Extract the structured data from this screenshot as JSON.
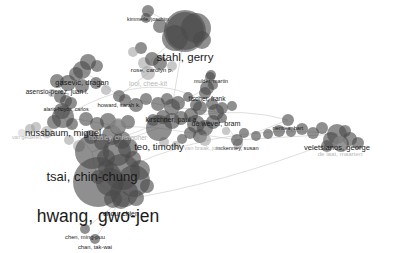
{
  "view": {
    "type": "network-map",
    "background": "#ffffff",
    "node_color": "#4a4a4a",
    "edge_color": "#d0d0d0",
    "label_color": "#1a1a1a",
    "width": 401,
    "height": 253
  },
  "chart_data": {
    "type": "scatter",
    "title": "",
    "xlabel": "",
    "ylabel": "",
    "nodes": [
      {
        "label": "kimmerle, joachim",
        "x": 148,
        "y": 11,
        "r": 6,
        "font": 5.2,
        "tone": "dark",
        "lx": 148,
        "ly": 11
      },
      {
        "label": "stahl, gerry",
        "x": 185,
        "y": 31,
        "r": 21,
        "font": 11.5,
        "tone": "dark",
        "lx": 185,
        "ly": 30
      },
      {
        "label": "rose, carolyn p.",
        "x": 152,
        "y": 59,
        "r": 7,
        "font": 6.2,
        "tone": "dark",
        "lx": 152,
        "ly": 59
      },
      {
        "label": "gasevic, dragan",
        "x": 82,
        "y": 70,
        "r": 9,
        "font": 7.6,
        "tone": "dark",
        "lx": 82,
        "ly": 69
      },
      {
        "label": "asensio-perez, juan i.",
        "x": 57,
        "y": 81,
        "r": 7,
        "font": 6.6,
        "tone": "dark",
        "lx": 57,
        "ly": 81
      },
      {
        "label": "looi, chee-kit",
        "x": 148,
        "y": 73,
        "r": 7,
        "font": 6.8,
        "tone": "faint",
        "lx": 148,
        "ly": 73
      },
      {
        "label": "mulder, martin",
        "x": 211,
        "y": 75,
        "r": 5,
        "font": 5.4,
        "tone": "dark",
        "lx": 211,
        "ly": 74
      },
      {
        "label": "fischer, frank",
        "x": 207,
        "y": 88,
        "r": 7,
        "font": 6.5,
        "tone": "dark",
        "lx": 207,
        "ly": 88
      },
      {
        "label": "alario-hoyos, carlos",
        "x": 66,
        "y": 101,
        "r": 6,
        "font": 5.2,
        "tone": "dark",
        "lx": 66,
        "ly": 101
      },
      {
        "label": "howard, sarah k.",
        "x": 119,
        "y": 96,
        "r": 6,
        "font": 5.8,
        "tone": "dark",
        "lx": 119,
        "ly": 96
      },
      {
        "label": "kirschner, paul a.",
        "x": 172,
        "y": 107,
        "r": 8,
        "font": 7.0,
        "tone": "dark",
        "lx": 172,
        "ly": 107
      },
      {
        "label": "de wever, bram",
        "x": 216,
        "y": 112,
        "r": 8,
        "font": 7.2,
        "tone": "dark",
        "lx": 216,
        "ly": 112
      },
      {
        "label": "nussbaum, miguel",
        "x": 63,
        "y": 117,
        "r": 11,
        "font": 9.4,
        "tone": "dark",
        "lx": 63,
        "ly": 116
      },
      {
        "label": "hoadley, christopher",
        "x": 118,
        "y": 126,
        "r": 8,
        "font": 6.5,
        "tone": "faint",
        "lx": 118,
        "ly": 126
      },
      {
        "label": "teo, timothy",
        "x": 159,
        "y": 128,
        "r": 13,
        "font": 9.6,
        "tone": "dark",
        "lx": 159,
        "ly": 128
      },
      {
        "label": "rienties, bart",
        "x": 288,
        "y": 120,
        "r": 6,
        "font": 5.6,
        "tone": "dark",
        "lx": 288,
        "ly": 120
      },
      {
        "label": "veletsianos, george",
        "x": 337,
        "y": 134,
        "r": 10,
        "font": 7.6,
        "tone": "dark",
        "lx": 337,
        "ly": 133
      },
      {
        "label": "mckenney, susan",
        "x": 237,
        "y": 140,
        "r": 6,
        "font": 5.6,
        "tone": "dark",
        "lx": 237,
        "ly": 140
      },
      {
        "label": "van gelderen, ...",
        "x": 30,
        "y": 129,
        "r": 5,
        "font": 5.0,
        "tone": "faint",
        "lx": 30,
        "ly": 129
      },
      {
        "label": "de laat, maarten",
        "x": 340,
        "y": 143,
        "r": 7,
        "font": 6.2,
        "tone": "faint",
        "lx": 340,
        "ly": 143
      },
      {
        "label": "van braak, johan",
        "x": 205,
        "y": 140,
        "r": 6,
        "font": 5.6,
        "tone": "faint",
        "lx": 205,
        "ly": 140
      },
      {
        "label": "tsai, chin-chung",
        "x": 92,
        "y": 152,
        "r": 17,
        "font": 13.0,
        "tone": "dark",
        "lx": 92,
        "ly": 151
      },
      {
        "label": "hwang, gwo-jen",
        "x": 98,
        "y": 182,
        "r": 25,
        "font": 17.5,
        "tone": "dark",
        "lx": 98,
        "ly": 181
      },
      {
        "label": "chou, chien",
        "x": 121,
        "y": 200,
        "r": 9,
        "font": 7.0,
        "tone": "dark",
        "lx": 121,
        "ly": 200
      },
      {
        "label": "chen, ming-puu",
        "x": 85,
        "y": 229,
        "r": 5,
        "font": 5.8,
        "tone": "dark",
        "lx": 85,
        "ly": 229
      },
      {
        "label": "chan, tak-wai",
        "x": 95,
        "y": 239,
        "r": 5,
        "font": 5.8,
        "tone": "dark",
        "lx": 95,
        "ly": 239
      }
    ],
    "cluster_blobs": [
      {
        "x": 185,
        "y": 31,
        "r": 19,
        "tone": "dark"
      },
      {
        "x": 196,
        "y": 28,
        "r": 15,
        "tone": "dark"
      },
      {
        "x": 175,
        "y": 38,
        "r": 13,
        "tone": "dark"
      },
      {
        "x": 202,
        "y": 40,
        "r": 9,
        "tone": "dark"
      },
      {
        "x": 160,
        "y": 26,
        "r": 7,
        "tone": "dark"
      },
      {
        "x": 146,
        "y": 18,
        "r": 5,
        "tone": "dark"
      },
      {
        "x": 141,
        "y": 48,
        "r": 6,
        "tone": "dark"
      },
      {
        "x": 133,
        "y": 52,
        "r": 5,
        "tone": "light"
      },
      {
        "x": 160,
        "y": 63,
        "r": 7,
        "tone": "dark"
      },
      {
        "x": 172,
        "y": 66,
        "r": 5,
        "tone": "light"
      },
      {
        "x": 144,
        "y": 63,
        "r": 6,
        "tone": "light"
      },
      {
        "x": 88,
        "y": 62,
        "r": 8,
        "tone": "dark"
      },
      {
        "x": 97,
        "y": 66,
        "r": 6,
        "tone": "dark"
      },
      {
        "x": 76,
        "y": 74,
        "r": 7,
        "tone": "dark"
      },
      {
        "x": 68,
        "y": 83,
        "r": 8,
        "tone": "dark"
      },
      {
        "x": 82,
        "y": 86,
        "r": 7,
        "tone": "dark"
      },
      {
        "x": 96,
        "y": 83,
        "r": 6,
        "tone": "dark"
      },
      {
        "x": 106,
        "y": 90,
        "r": 5,
        "tone": "light"
      },
      {
        "x": 60,
        "y": 97,
        "r": 6,
        "tone": "dark"
      },
      {
        "x": 71,
        "y": 103,
        "r": 6,
        "tone": "dark"
      },
      {
        "x": 52,
        "y": 93,
        "r": 4,
        "tone": "light"
      },
      {
        "x": 125,
        "y": 100,
        "r": 6,
        "tone": "dark"
      },
      {
        "x": 136,
        "y": 105,
        "r": 7,
        "tone": "dark"
      },
      {
        "x": 146,
        "y": 99,
        "r": 6,
        "tone": "dark"
      },
      {
        "x": 158,
        "y": 104,
        "r": 7,
        "tone": "dark"
      },
      {
        "x": 167,
        "y": 99,
        "r": 6,
        "tone": "dark"
      },
      {
        "x": 178,
        "y": 103,
        "r": 7,
        "tone": "dark"
      },
      {
        "x": 188,
        "y": 97,
        "r": 5,
        "tone": "dark"
      },
      {
        "x": 196,
        "y": 105,
        "r": 6,
        "tone": "dark"
      },
      {
        "x": 205,
        "y": 93,
        "r": 6,
        "tone": "dark"
      },
      {
        "x": 213,
        "y": 85,
        "r": 5,
        "tone": "dark"
      },
      {
        "x": 210,
        "y": 77,
        "r": 5,
        "tone": "dark"
      },
      {
        "x": 200,
        "y": 108,
        "r": 7,
        "tone": "dark"
      },
      {
        "x": 212,
        "y": 104,
        "r": 6,
        "tone": "dark"
      },
      {
        "x": 222,
        "y": 108,
        "r": 6,
        "tone": "dark"
      },
      {
        "x": 232,
        "y": 106,
        "r": 5,
        "tone": "dark"
      },
      {
        "x": 191,
        "y": 115,
        "r": 7,
        "tone": "dark"
      },
      {
        "x": 181,
        "y": 118,
        "r": 7,
        "tone": "dark"
      },
      {
        "x": 172,
        "y": 121,
        "r": 8,
        "tone": "dark"
      },
      {
        "x": 163,
        "y": 117,
        "r": 7,
        "tone": "dark"
      },
      {
        "x": 153,
        "y": 120,
        "r": 6,
        "tone": "dark"
      },
      {
        "x": 196,
        "y": 124,
        "r": 9,
        "tone": "dark"
      },
      {
        "x": 205,
        "y": 128,
        "r": 8,
        "tone": "dark"
      },
      {
        "x": 213,
        "y": 122,
        "r": 7,
        "tone": "dark"
      },
      {
        "x": 200,
        "y": 136,
        "r": 7,
        "tone": "dark"
      },
      {
        "x": 190,
        "y": 133,
        "r": 6,
        "tone": "dark"
      },
      {
        "x": 182,
        "y": 139,
        "r": 5,
        "tone": "dark"
      },
      {
        "x": 222,
        "y": 118,
        "r": 5,
        "tone": "dark"
      },
      {
        "x": 62,
        "y": 111,
        "r": 8,
        "tone": "dark"
      },
      {
        "x": 54,
        "y": 122,
        "r": 7,
        "tone": "dark"
      },
      {
        "x": 72,
        "y": 124,
        "r": 6,
        "tone": "dark"
      },
      {
        "x": 86,
        "y": 119,
        "r": 7,
        "tone": "dark"
      },
      {
        "x": 97,
        "y": 124,
        "r": 7,
        "tone": "dark"
      },
      {
        "x": 108,
        "y": 121,
        "r": 8,
        "tone": "dark"
      },
      {
        "x": 118,
        "y": 127,
        "r": 8,
        "tone": "dark"
      },
      {
        "x": 128,
        "y": 122,
        "r": 7,
        "tone": "dark"
      },
      {
        "x": 112,
        "y": 135,
        "r": 10,
        "tone": "dark"
      },
      {
        "x": 122,
        "y": 140,
        "r": 9,
        "tone": "dark"
      },
      {
        "x": 102,
        "y": 142,
        "r": 8,
        "tone": "dark"
      },
      {
        "x": 91,
        "y": 137,
        "r": 7,
        "tone": "dark"
      },
      {
        "x": 47,
        "y": 132,
        "r": 6,
        "tone": "light"
      },
      {
        "x": 36,
        "y": 127,
        "r": 5,
        "tone": "light"
      },
      {
        "x": 117,
        "y": 152,
        "r": 14,
        "tone": "dark"
      },
      {
        "x": 128,
        "y": 148,
        "r": 10,
        "tone": "dark"
      },
      {
        "x": 106,
        "y": 158,
        "r": 9,
        "tone": "dark"
      },
      {
        "x": 133,
        "y": 159,
        "r": 8,
        "tone": "dark"
      },
      {
        "x": 122,
        "y": 172,
        "r": 18,
        "tone": "dark"
      },
      {
        "x": 134,
        "y": 181,
        "r": 16,
        "tone": "dark"
      },
      {
        "x": 110,
        "y": 182,
        "r": 14,
        "tone": "dark"
      },
      {
        "x": 124,
        "y": 193,
        "r": 14,
        "tone": "dark"
      },
      {
        "x": 140,
        "y": 170,
        "r": 10,
        "tone": "dark"
      },
      {
        "x": 106,
        "y": 168,
        "r": 8,
        "tone": "dark"
      },
      {
        "x": 98,
        "y": 177,
        "r": 7,
        "tone": "dark"
      },
      {
        "x": 147,
        "y": 186,
        "r": 7,
        "tone": "dark"
      },
      {
        "x": 113,
        "y": 199,
        "r": 9,
        "tone": "dark"
      },
      {
        "x": 136,
        "y": 198,
        "r": 8,
        "tone": "dark"
      },
      {
        "x": 79,
        "y": 146,
        "r": 6,
        "tone": "light"
      },
      {
        "x": 69,
        "y": 140,
        "r": 5,
        "tone": "light"
      },
      {
        "x": 244,
        "y": 133,
        "r": 5,
        "tone": "dark"
      },
      {
        "x": 256,
        "y": 136,
        "r": 5,
        "tone": "dark"
      },
      {
        "x": 268,
        "y": 134,
        "r": 5,
        "tone": "dark"
      },
      {
        "x": 279,
        "y": 131,
        "r": 6,
        "tone": "dark"
      },
      {
        "x": 291,
        "y": 132,
        "r": 5,
        "tone": "dark"
      },
      {
        "x": 302,
        "y": 129,
        "r": 6,
        "tone": "dark"
      },
      {
        "x": 313,
        "y": 133,
        "r": 6,
        "tone": "dark"
      },
      {
        "x": 322,
        "y": 128,
        "r": 6,
        "tone": "dark"
      },
      {
        "x": 331,
        "y": 140,
        "r": 8,
        "tone": "dark"
      },
      {
        "x": 341,
        "y": 144,
        "r": 8,
        "tone": "dark"
      },
      {
        "x": 350,
        "y": 139,
        "r": 7,
        "tone": "dark"
      },
      {
        "x": 358,
        "y": 143,
        "r": 6,
        "tone": "dark"
      },
      {
        "x": 345,
        "y": 131,
        "r": 6,
        "tone": "dark"
      },
      {
        "x": 327,
        "y": 146,
        "r": 6,
        "tone": "dark"
      },
      {
        "x": 238,
        "y": 144,
        "r": 5,
        "tone": "light"
      },
      {
        "x": 226,
        "y": 131,
        "r": 4,
        "tone": "light"
      },
      {
        "x": 22,
        "y": 133,
        "r": 4,
        "tone": "pale"
      },
      {
        "x": 164,
        "y": 142,
        "r": 5,
        "tone": "light"
      },
      {
        "x": 176,
        "y": 145,
        "r": 4,
        "tone": "light"
      }
    ],
    "edges": [
      {
        "x1": 185,
        "y1": 31,
        "x2": 152,
        "y2": 59
      },
      {
        "x1": 152,
        "y1": 59,
        "x2": 148,
        "y2": 73
      },
      {
        "x1": 148,
        "y1": 73,
        "x2": 119,
        "y2": 96
      },
      {
        "x1": 119,
        "y1": 96,
        "x2": 82,
        "y2": 70
      },
      {
        "x1": 82,
        "y1": 70,
        "x2": 57,
        "y2": 81
      },
      {
        "x1": 57,
        "y1": 81,
        "x2": 66,
        "y2": 101
      },
      {
        "x1": 66,
        "y1": 101,
        "x2": 63,
        "y2": 117
      },
      {
        "x1": 63,
        "y1": 117,
        "x2": 92,
        "y2": 152
      },
      {
        "x1": 92,
        "y1": 152,
        "x2": 98,
        "y2": 182
      },
      {
        "x1": 98,
        "y1": 182,
        "x2": 121,
        "y2": 200
      },
      {
        "x1": 121,
        "y1": 200,
        "x2": 85,
        "y2": 229
      },
      {
        "x1": 121,
        "y1": 200,
        "x2": 95,
        "y2": 239
      },
      {
        "x1": 119,
        "y1": 96,
        "x2": 172,
        "y2": 107
      },
      {
        "x1": 172,
        "y1": 107,
        "x2": 207,
        "y2": 88
      },
      {
        "x1": 207,
        "y1": 88,
        "x2": 211,
        "y2": 75
      },
      {
        "x1": 172,
        "y1": 107,
        "x2": 216,
        "y2": 112
      },
      {
        "x1": 216,
        "y1": 112,
        "x2": 237,
        "y2": 140
      },
      {
        "x1": 237,
        "y1": 140,
        "x2": 288,
        "y2": 120
      },
      {
        "x1": 237,
        "y1": 140,
        "x2": 337,
        "y2": 134
      },
      {
        "x1": 159,
        "y1": 128,
        "x2": 237,
        "y2": 140
      },
      {
        "x1": 159,
        "y1": 128,
        "x2": 92,
        "y2": 152
      },
      {
        "x1": 118,
        "y1": 126,
        "x2": 159,
        "y2": 128
      },
      {
        "x1": 63,
        "y1": 117,
        "x2": 118,
        "y2": 126
      },
      {
        "x1": 185,
        "y1": 31,
        "x2": 172,
        "y2": 107
      },
      {
        "x1": 148,
        "y1": 11,
        "x2": 185,
        "y2": 31
      }
    ],
    "arc_edges": [
      {
        "x1": 92,
        "y1": 152,
        "cx": 200,
        "cy": 95,
        "x2": 288,
        "y2": 120
      },
      {
        "x1": 98,
        "y1": 182,
        "cx": 210,
        "cy": 120,
        "x2": 337,
        "y2": 134
      },
      {
        "x1": 63,
        "y1": 117,
        "cx": 160,
        "cy": 60,
        "x2": 216,
        "y2": 112
      },
      {
        "x1": 121,
        "y1": 200,
        "cx": 220,
        "cy": 185,
        "x2": 337,
        "y2": 140
      }
    ]
  }
}
